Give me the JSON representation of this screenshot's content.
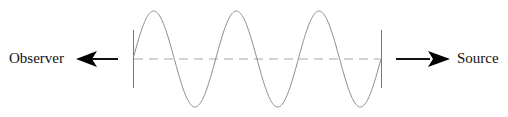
{
  "diagram": {
    "labels": {
      "observer": "Observer",
      "source": "Source"
    },
    "wave": {
      "cycles": 3,
      "x_start": 133,
      "x_end": 381,
      "midline_y": 59,
      "amplitude": 48,
      "color": "#8a8a8a"
    },
    "midline": {
      "style": "dashed",
      "color": "#a0a0a0"
    },
    "arrows": [
      {
        "name": "observer-arrow",
        "direction": "left",
        "color": "#000000"
      },
      {
        "name": "source-arrow",
        "direction": "right",
        "color": "#000000"
      }
    ]
  }
}
